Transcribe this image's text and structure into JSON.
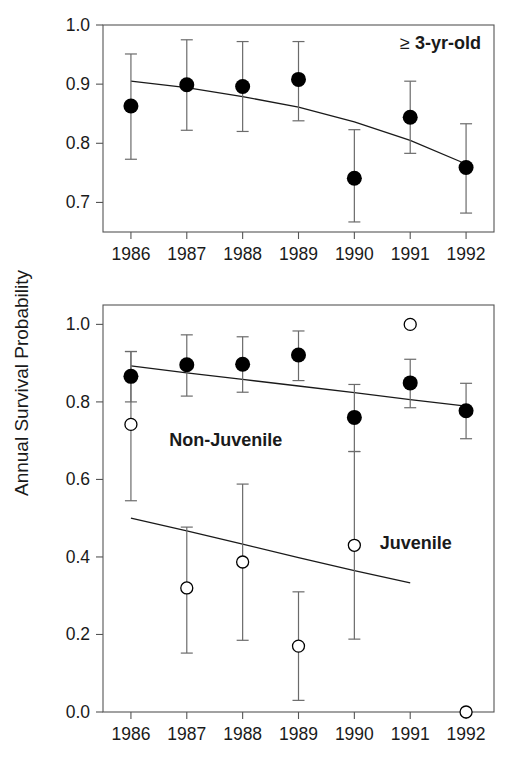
{
  "figure": {
    "ylabel": "Annual Survival Probability"
  },
  "chart_data": [
    {
      "type": "scatter",
      "panel": "top",
      "title": "",
      "annotation": "≥ 3-yr-old",
      "annotation_symbol": "≥",
      "annotation_text": "3-yr-old",
      "xlabel": "",
      "ylabel": "Annual Survival Probability",
      "categories": [
        "1986",
        "1987",
        "1988",
        "1989",
        "1990",
        "1991",
        "1992"
      ],
      "x": [
        1986,
        1987,
        1988,
        1989,
        1990,
        1991,
        1992
      ],
      "ylim": [
        0.65,
        1.0
      ],
      "xlim": [
        1985.5,
        1992.5
      ],
      "yticks": [
        0.7,
        0.8,
        0.9,
        1.0
      ],
      "ytick_labels": [
        "0.7",
        "0.8",
        "0.9",
        "1.0"
      ],
      "grid": false,
      "legend": "none",
      "series": [
        {
          "name": "≥ 3-yr-old",
          "marker": "filled-circle",
          "values": [
            0.863,
            0.899,
            0.896,
            0.908,
            0.741,
            0.844,
            0.759
          ],
          "err_low": [
            0.773,
            0.822,
            0.82,
            0.838,
            0.667,
            0.783,
            0.682
          ],
          "err_high": [
            0.951,
            0.975,
            0.972,
            0.972,
            0.823,
            0.905,
            0.833
          ]
        }
      ],
      "trend_line": {
        "name": "fitted-trend",
        "style": "solid",
        "points": [
          {
            "x": 1986,
            "y": 0.905
          },
          {
            "x": 1987,
            "y": 0.894
          },
          {
            "x": 1988,
            "y": 0.879
          },
          {
            "x": 1989,
            "y": 0.861
          },
          {
            "x": 1990,
            "y": 0.836
          },
          {
            "x": 1991,
            "y": 0.805
          },
          {
            "x": 1992,
            "y": 0.765
          }
        ]
      }
    },
    {
      "type": "scatter",
      "panel": "bottom",
      "title": "",
      "xlabel": "",
      "ylabel": "Annual Survival Probability",
      "categories": [
        "1986",
        "1987",
        "1988",
        "1989",
        "1990",
        "1991",
        "1992"
      ],
      "x": [
        1986,
        1987,
        1988,
        1989,
        1990,
        1991,
        1992
      ],
      "ylim": [
        0.0,
        1.05
      ],
      "xlim": [
        1985.5,
        1992.5
      ],
      "yticks": [
        0.0,
        0.2,
        0.4,
        0.6,
        0.8,
        1.0
      ],
      "ytick_labels": [
        "0.0",
        "0.2",
        "0.4",
        "0.6",
        "0.8",
        "1.0"
      ],
      "grid": false,
      "legend": "inline-labels",
      "series": [
        {
          "name": "Non-Juvenile",
          "marker": "filled-circle",
          "values": [
            0.866,
            0.896,
            0.897,
            0.921,
            0.76,
            0.849,
            0.777
          ],
          "err_low": [
            0.8,
            0.815,
            0.825,
            0.855,
            0.672,
            0.785,
            0.705
          ],
          "err_high": [
            0.93,
            0.973,
            0.968,
            0.983,
            0.845,
            0.91,
            0.848
          ]
        },
        {
          "name": "Juvenile",
          "marker": "open-circle",
          "values": [
            0.742,
            0.32,
            0.387,
            0.17,
            0.43,
            1.0,
            0.0
          ],
          "err_low": [
            0.545,
            0.152,
            0.185,
            0.03,
            0.188,
            null,
            null
          ],
          "err_high": [
            0.93,
            0.477,
            0.588,
            0.31,
            0.672,
            null,
            null
          ]
        }
      ],
      "trend_line": {
        "name": "fitted-trend-juvenile",
        "style": "solid",
        "points": [
          {
            "x": 1986,
            "y": 0.5
          },
          {
            "x": 1987,
            "y": 0.467
          },
          {
            "x": 1988,
            "y": 0.433
          },
          {
            "x": 1989,
            "y": 0.398
          },
          {
            "x": 1990,
            "y": 0.365
          },
          {
            "x": 1991,
            "y": 0.333
          }
        ]
      },
      "trend_line_2": {
        "name": "fitted-trend-nonjuvenile",
        "style": "solid",
        "points": [
          {
            "x": 1986,
            "y": 0.893
          },
          {
            "x": 1987,
            "y": 0.875
          },
          {
            "x": 1988,
            "y": 0.858
          },
          {
            "x": 1989,
            "y": 0.841
          },
          {
            "x": 1990,
            "y": 0.824
          },
          {
            "x": 1991,
            "y": 0.806
          },
          {
            "x": 1992,
            "y": 0.789
          }
        ]
      },
      "annotations": [
        {
          "name": "non-juvenile-label",
          "text": "Non-Juvenile",
          "x": 1987.7,
          "y": 0.685
        },
        {
          "name": "juvenile-label",
          "text": "Juvenile",
          "x": 1991.1,
          "y": 0.42
        }
      ]
    }
  ],
  "colors": {
    "axis": "#555555",
    "data": "#000000",
    "error_bar": "#6b6b6b",
    "trend": "#1a1a1a",
    "text": "#1a1a1a",
    "background": "#ffffff"
  }
}
